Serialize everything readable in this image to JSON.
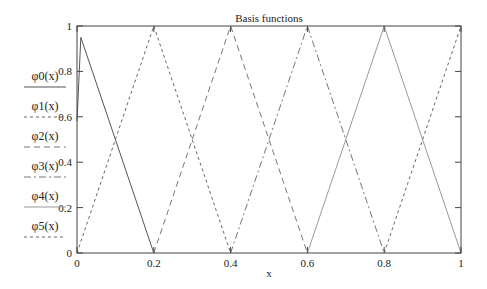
{
  "chart_data": {
    "type": "line",
    "title": "Basis functions",
    "xlabel": "x",
    "ylabel": "",
    "xlim": [
      0,
      1
    ],
    "ylim": [
      0,
      1
    ],
    "grid": false,
    "legend_position": "left-outside",
    "xticks": [
      "0",
      "0.2",
      "0.4",
      "0.6",
      "0.8",
      "1"
    ],
    "yticks": [
      "0",
      "0.2",
      "0.4",
      "0.6",
      "0.8",
      "1"
    ],
    "series": [
      {
        "name": "φ0(x)",
        "style": "solid",
        "color": "#555555",
        "x": [
          0,
          0.01,
          0.2
        ],
        "y": [
          0.58,
          0.95,
          0
        ]
      },
      {
        "name": "φ1(x)",
        "style": "dashed",
        "color": "#666666",
        "x": [
          0,
          0.2,
          0.4
        ],
        "y": [
          0,
          1,
          0
        ]
      },
      {
        "name": "φ2(x)",
        "style": "long-dash",
        "color": "#777777",
        "x": [
          0.2,
          0.4,
          0.6
        ],
        "y": [
          0,
          1,
          0
        ]
      },
      {
        "name": "φ3(x)",
        "style": "dash-dot",
        "color": "#777777",
        "x": [
          0.4,
          0.6,
          0.8
        ],
        "y": [
          0,
          1,
          0
        ]
      },
      {
        "name": "φ4(x)",
        "style": "solid-light",
        "color": "#999999",
        "x": [
          0.6,
          0.8,
          1.0
        ],
        "y": [
          0,
          1,
          0
        ]
      },
      {
        "name": "φ5(x)",
        "style": "dashed",
        "color": "#666666",
        "x": [
          0.8,
          1.0
        ],
        "y": [
          0,
          1
        ]
      }
    ]
  }
}
